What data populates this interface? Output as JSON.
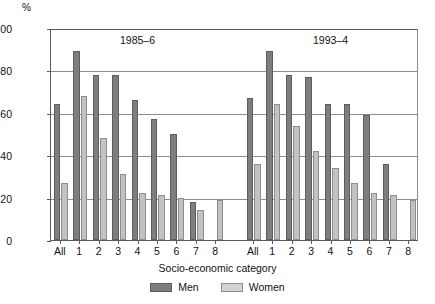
{
  "chart_data": {
    "type": "bar",
    "title": "",
    "xlabel": "Socio-economic category",
    "ylabel": "%",
    "ylim": [
      0,
      100
    ],
    "yticks": [
      0,
      20,
      40,
      60,
      80,
      100
    ],
    "grid": true,
    "legend_position": "bottom",
    "panel_labels": [
      "1985–6",
      "1993–4"
    ],
    "categories": [
      "All",
      "1",
      "2",
      "3",
      "4",
      "5",
      "6",
      "7",
      "8",
      "All",
      "1",
      "2",
      "3",
      "4",
      "5",
      "6",
      "7",
      "8"
    ],
    "series": [
      {
        "name": "Men",
        "color": "#7e7e7e",
        "values": [
          64,
          89,
          78,
          78,
          66,
          57,
          50,
          18,
          null,
          67,
          89,
          78,
          77,
          64,
          64,
          59,
          36,
          null
        ]
      },
      {
        "name": "Women",
        "color": "#c2c2c2",
        "values": [
          27,
          68,
          48,
          31,
          22,
          21,
          20,
          14,
          19,
          36,
          64,
          54,
          42,
          34,
          27,
          22,
          21,
          19
        ]
      }
    ]
  },
  "axis": {
    "unit_label": "%",
    "x_title": "Socio-economic category"
  },
  "legend": {
    "items": [
      {
        "label": "Men"
      },
      {
        "label": "Women"
      }
    ]
  },
  "icons": {
    "men_swatch": "men-color-swatch",
    "women_swatch": "women-color-swatch"
  }
}
